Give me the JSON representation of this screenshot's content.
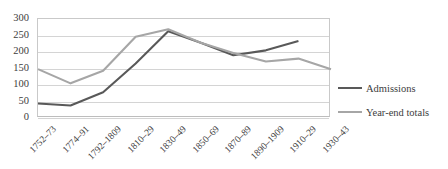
{
  "chart_data": {
    "type": "line",
    "title": "",
    "xlabel": "",
    "ylabel": "",
    "ylim": [
      0,
      300
    ],
    "ytick_labels": [
      "300",
      "250",
      "200",
      "150",
      "100",
      "50",
      "0"
    ],
    "ytick_values": [
      300,
      250,
      200,
      150,
      100,
      50,
      0
    ],
    "grid": true,
    "legend_position": "right",
    "categories": [
      "1752–73",
      "1774–91",
      "1792–1809",
      "1810–29",
      "1830–49",
      "1850–69",
      "1870–89",
      "1890–1909",
      "1910–29",
      "1930–43"
    ],
    "series": [
      {
        "name": "Admissions",
        "color": "#595959",
        "values": [
          44,
          38,
          78,
          165,
          263,
          228,
          190,
          205,
          233,
          null
        ]
      },
      {
        "name": "Year-end totals",
        "color": "#a6a6a6",
        "values": [
          148,
          105,
          143,
          246,
          269,
          228,
          197,
          171,
          180,
          148
        ]
      }
    ]
  },
  "legend": {
    "items": [
      {
        "label": "Admissions",
        "color": "#595959"
      },
      {
        "label": "Year-end totals",
        "color": "#a6a6a6"
      }
    ]
  },
  "colors": {
    "admissions": "#595959",
    "year_end_totals": "#a6a6a6",
    "gridline": "#d4d4d4",
    "plot_border": "#c9c9c9",
    "text": "#3d3d3d",
    "background": "#ffffff"
  }
}
